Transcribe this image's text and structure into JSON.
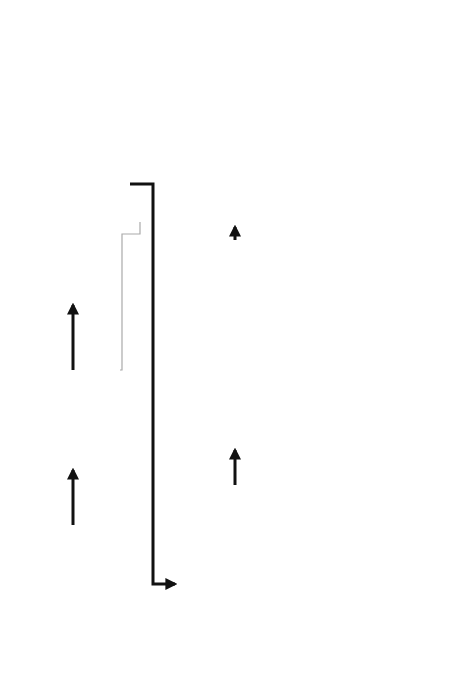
{
  "diagram": {
    "orientation": "rotated-90-ccw",
    "nodes": {
      "design_objectives": {
        "lines": [
          "Design",
          "objectives"
        ]
      },
      "identify_targets": {
        "lines": [
          "Identify user",
          "targets and",
          "specify these"
        ]
      },
      "map_transformation": {
        "lines": [
          "Map transformation process with required functions",
          "(Hubka–Eder map)"
        ],
        "inset": {
          "executing_systems": "Executing systems",
          "active_environment": "Active Environment",
          "active_environment_sub": "AEn",
          "systems": [
            "Human system HuS",
            "Biological system BioS",
            "Technical system TS",
            "Information system IS",
            "Management & Goal system MGS"
          ],
          "effect_label": "Effects",
          "phases": [
            "Preparing phase",
            "Executing phase",
            "Finishing phase"
          ],
          "process_label": "Transformation process, TrP",
          "operand_in": [
            "Od1",
            "Od2"
          ],
          "operand_out": [
            "Od1'",
            "Od2'"
          ]
        }
      },
      "identify_functional": {
        "lines": [
          "Identify functional elements of the design"
        ]
      },
      "generate_permutations": {
        "lines": [
          "Generate permutations of the elements"
        ]
      },
      "screen_permutations": {
        "lines": [
          "Screen permutations versus the targets"
        ],
        "inner": [
          "Identified",
          "user targets",
          "and",
          "specification"
        ]
      },
      "score_high_ranked": {
        "lines": [
          "Score high-ranked permutations versus",
          "the targets"
        ],
        "inner": [
          "Identify user",
          "targets and",
          "specify these"
        ]
      },
      "identify_anatomical": {
        "lines": [
          "Identify",
          "anatomical",
          "components"
        ]
      },
      "score_anatomical": {
        "lines": [
          "Score anatomical components for",
          "the high-ranked permutation"
        ]
      },
      "final_design": {
        "lines": [
          "Final",
          "design"
        ]
      }
    },
    "edges": [
      {
        "from": "design_objectives",
        "to": "identify_targets",
        "style": "bold"
      },
      {
        "from": "identify_targets",
        "to": "map_transformation",
        "style": "bold"
      },
      {
        "from": "identify_targets",
        "to": "screen_permutations",
        "style": "thin-gray"
      },
      {
        "from": "map_transformation",
        "to": "identify_functional",
        "style": "bold"
      },
      {
        "from": "identify_functional",
        "to": "generate_permutations",
        "style": "bold"
      },
      {
        "from": "generate_permutations",
        "to": "screen_permutations",
        "style": "bold"
      },
      {
        "from": "screen_permutations",
        "to": "score_high_ranked",
        "style": "bold"
      },
      {
        "from": "score_high_ranked",
        "to": "score_anatomical",
        "style": "thin-gray"
      },
      {
        "from": "identify_anatomical",
        "to": "score_anatomical",
        "style": "bold"
      },
      {
        "from": "score_anatomical",
        "to": "final_design",
        "style": "bold"
      }
    ],
    "functional_inset": {
      "group_labels": [
        "Interface elements",
        "Structural elements"
      ]
    },
    "colors": {
      "box_fill": "#f4f4f4",
      "box_stroke": "#6e6e6e",
      "arrow": "#111111",
      "thin_arrow": "#aaaaaa"
    }
  }
}
